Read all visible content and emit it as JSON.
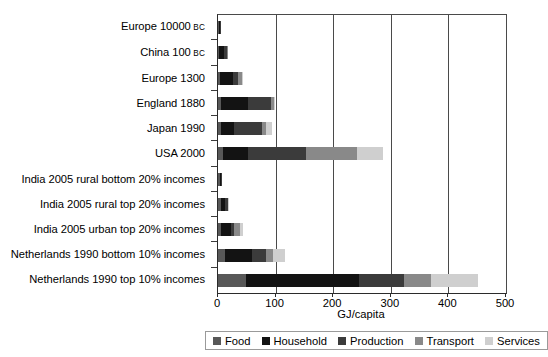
{
  "chart_data": {
    "type": "bar",
    "orientation": "horizontal",
    "stacked": true,
    "title": "",
    "xlabel": "GJ/capita",
    "ylabel": "",
    "xlim": [
      0,
      500
    ],
    "ylim": null,
    "grid": "vertical",
    "legend_position": "bottom",
    "xticks": [
      0,
      100,
      200,
      300,
      400,
      500
    ],
    "xtick_labels": [
      "0",
      "100",
      "200",
      "300",
      "400",
      "500"
    ],
    "categories": [
      "Europe 10000 BC",
      "China 100 BC",
      "Europe 1300",
      "England 1880",
      "Japan 1990",
      "USA 2000",
      "India 2005 rural bottom 20% incomes",
      "India 2005 rural top 20% incomes",
      "India 2005 urban top 20% incomes",
      "Netherlands 1990 bottom 10% incomes",
      "Netherlands 1990 top 10% incomes"
    ],
    "series": [
      {
        "name": "Food",
        "color": "#585858",
        "values": [
          1,
          2,
          4,
          5,
          5,
          8,
          3,
          5,
          6,
          12,
          48
        ]
      },
      {
        "name": "Household",
        "color": "#131313",
        "values": [
          3,
          9,
          22,
          47,
          22,
          44,
          3,
          8,
          16,
          47,
          197
        ]
      },
      {
        "name": "Production",
        "color": "#3b3b3b",
        "values": [
          1,
          4,
          9,
          40,
          49,
          100,
          1,
          4,
          5,
          24,
          78
        ]
      },
      {
        "name": "Transport",
        "color": "#898989",
        "values": [
          0,
          1,
          7,
          5,
          7,
          90,
          0,
          1,
          12,
          12,
          46
        ]
      },
      {
        "name": "Services",
        "color": "#cfcfcf",
        "values": [
          0,
          0,
          2,
          2,
          11,
          45,
          0,
          1,
          5,
          21,
          82
        ]
      }
    ]
  },
  "axis": {
    "x_title": "GJ/capita"
  },
  "category_labels": [
    {
      "main": "Europe 10000",
      "era": "BC"
    },
    {
      "main": "China 100",
      "era": "BC"
    },
    {
      "main": "Europe 1300",
      "era": ""
    },
    {
      "main": "England 1880",
      "era": ""
    },
    {
      "main": "Japan 1990",
      "era": ""
    },
    {
      "main": "USA 2000",
      "era": ""
    },
    {
      "main": "India 2005 rural bottom 20% incomes",
      "era": ""
    },
    {
      "main": "India 2005 rural top 20% incomes",
      "era": ""
    },
    {
      "main": "India 2005 urban top 20% incomes",
      "era": ""
    },
    {
      "main": "Netherlands 1990 bottom 10% incomes",
      "era": ""
    },
    {
      "main": "Netherlands 1990 top 10% incomes",
      "era": ""
    }
  ]
}
